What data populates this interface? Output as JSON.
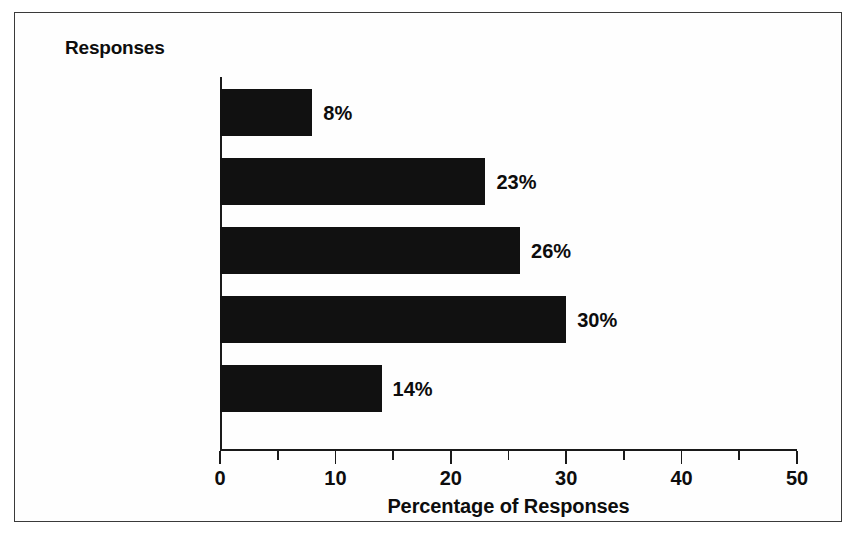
{
  "figure": {
    "header": "Responses",
    "axis_title": "Percentage of Responses"
  },
  "chart_data": {
    "type": "bar",
    "orientation": "horizontal",
    "title": "",
    "subtitle": "",
    "xlabel": "Percentage of Responses",
    "ylabel": "Responses",
    "xlim": [
      0,
      50
    ],
    "grid": false,
    "legend": null,
    "bar_color": "#111111",
    "categories": [
      "Marked success\nthroughout\norganization",
      "Substantial success",
      "Moderate success",
      "Limited success",
      "Little if any\nsuccess to date"
    ],
    "values": [
      8,
      23,
      26,
      30,
      14
    ],
    "value_labels": [
      "8%",
      "23%",
      "26%",
      "30%",
      "14%"
    ],
    "xticks": [
      0,
      10,
      20,
      30,
      40,
      50
    ],
    "xtick_labels": [
      "0",
      "10",
      "20",
      "30",
      "40",
      "50"
    ],
    "xminorticks": [
      5,
      15,
      25,
      35,
      45
    ],
    "units": "percent"
  }
}
